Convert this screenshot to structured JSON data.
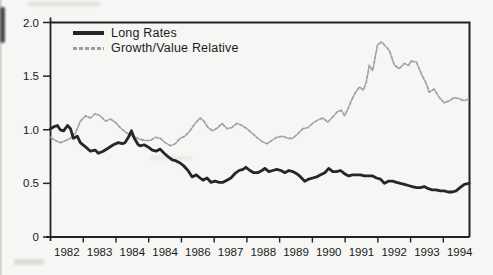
{
  "figure": {
    "background": "#f6f6f4",
    "frame_color": "#232323",
    "text_color": "#1a1a1a"
  },
  "legend": {
    "position": "top-left-inside",
    "items": [
      {
        "label": "Long Rates",
        "swatch_style": "solid-thick",
        "color": "#262626"
      },
      {
        "label": "Growth/Value Relative",
        "swatch_style": "dashed-thin",
        "color": "#a0a0a0"
      }
    ]
  },
  "chart_data": {
    "type": "line",
    "title": "",
    "xlabel": "",
    "ylabel": "",
    "grid": false,
    "legend_position": "top-left-inside",
    "x_axis": {
      "min": 1981.5,
      "max": 1994.3,
      "tick_label_positions": [
        1982,
        1983,
        1984,
        1985,
        1986,
        1987,
        1988,
        1989,
        1990,
        1991,
        1992,
        1993,
        1994
      ],
      "tick_labels": [
        "1982",
        "1983",
        "1984",
        "1984",
        "1986",
        "1987",
        "1988",
        "1989",
        "1990",
        "1991",
        "1992",
        "1993",
        "1994"
      ],
      "minor_tick_positions": [
        1982.5,
        1983.5,
        1984.5,
        1985.5,
        1986.5,
        1987.5,
        1988.5,
        1989.5,
        1990.5,
        1991.5,
        1992.5,
        1993.5
      ]
    },
    "y_axis": {
      "min": 0,
      "max": 2.0,
      "tick_values": [
        0,
        0.5,
        1.0,
        1.5,
        2.0
      ],
      "tick_labels": [
        "0",
        "0.5",
        "1.0",
        "1.5",
        "2.0"
      ]
    },
    "series": [
      {
        "name": "Long Rates",
        "color": "#262626",
        "style": "solid",
        "stroke_width": 2.8,
        "points": [
          [
            1981.5,
            1.01
          ],
          [
            1981.62,
            1.03
          ],
          [
            1981.71,
            1.04
          ],
          [
            1981.8,
            1.0
          ],
          [
            1981.9,
            0.99
          ],
          [
            1982.02,
            1.04
          ],
          [
            1982.11,
            1.01
          ],
          [
            1982.2,
            0.92
          ],
          [
            1982.32,
            0.94
          ],
          [
            1982.41,
            0.88
          ],
          [
            1982.57,
            0.84
          ],
          [
            1982.72,
            0.8
          ],
          [
            1982.87,
            0.81
          ],
          [
            1982.96,
            0.78
          ],
          [
            1983.11,
            0.8
          ],
          [
            1983.27,
            0.83
          ],
          [
            1983.42,
            0.86
          ],
          [
            1983.57,
            0.88
          ],
          [
            1983.69,
            0.87
          ],
          [
            1983.78,
            0.88
          ],
          [
            1983.88,
            0.93
          ],
          [
            1983.97,
            0.99
          ],
          [
            1984.06,
            0.92
          ],
          [
            1984.18,
            0.86
          ],
          [
            1984.27,
            0.85
          ],
          [
            1984.36,
            0.86
          ],
          [
            1984.48,
            0.84
          ],
          [
            1984.61,
            0.81
          ],
          [
            1984.73,
            0.8
          ],
          [
            1984.85,
            0.82
          ],
          [
            1984.97,
            0.78
          ],
          [
            1985.09,
            0.75
          ],
          [
            1985.22,
            0.72
          ],
          [
            1985.34,
            0.71
          ],
          [
            1985.46,
            0.69
          ],
          [
            1985.58,
            0.66
          ],
          [
            1985.7,
            0.62
          ],
          [
            1985.83,
            0.56
          ],
          [
            1985.95,
            0.58
          ],
          [
            1986.07,
            0.55
          ],
          [
            1986.16,
            0.53
          ],
          [
            1986.28,
            0.55
          ],
          [
            1986.4,
            0.51
          ],
          [
            1986.53,
            0.52
          ],
          [
            1986.65,
            0.51
          ],
          [
            1986.77,
            0.51
          ],
          [
            1986.89,
            0.53
          ],
          [
            1987.01,
            0.55
          ],
          [
            1987.13,
            0.59
          ],
          [
            1987.26,
            0.62
          ],
          [
            1987.38,
            0.63
          ],
          [
            1987.47,
            0.65
          ],
          [
            1987.59,
            0.62
          ],
          [
            1987.71,
            0.6
          ],
          [
            1987.83,
            0.6
          ],
          [
            1987.96,
            0.62
          ],
          [
            1988.05,
            0.64
          ],
          [
            1988.17,
            0.61
          ],
          [
            1988.29,
            0.62
          ],
          [
            1988.41,
            0.63
          ],
          [
            1988.54,
            0.62
          ],
          [
            1988.66,
            0.6
          ],
          [
            1988.78,
            0.62
          ],
          [
            1988.9,
            0.61
          ],
          [
            1989.02,
            0.59
          ],
          [
            1989.14,
            0.56
          ],
          [
            1989.27,
            0.52
          ],
          [
            1989.39,
            0.54
          ],
          [
            1989.51,
            0.55
          ],
          [
            1989.63,
            0.56
          ],
          [
            1989.75,
            0.58
          ],
          [
            1989.88,
            0.6
          ],
          [
            1990.0,
            0.64
          ],
          [
            1990.12,
            0.61
          ],
          [
            1990.24,
            0.61
          ],
          [
            1990.36,
            0.62
          ],
          [
            1990.48,
            0.59
          ],
          [
            1990.61,
            0.57
          ],
          [
            1990.73,
            0.58
          ],
          [
            1990.85,
            0.58
          ],
          [
            1990.97,
            0.58
          ],
          [
            1991.09,
            0.57
          ],
          [
            1991.22,
            0.57
          ],
          [
            1991.34,
            0.57
          ],
          [
            1991.46,
            0.55
          ],
          [
            1991.58,
            0.54
          ],
          [
            1991.7,
            0.5
          ],
          [
            1991.82,
            0.52
          ],
          [
            1991.95,
            0.52
          ],
          [
            1992.07,
            0.51
          ],
          [
            1992.19,
            0.5
          ],
          [
            1992.31,
            0.49
          ],
          [
            1992.43,
            0.48
          ],
          [
            1992.55,
            0.47
          ],
          [
            1992.68,
            0.46
          ],
          [
            1992.8,
            0.46
          ],
          [
            1992.92,
            0.47
          ],
          [
            1993.04,
            0.45
          ],
          [
            1993.16,
            0.44
          ],
          [
            1993.28,
            0.44
          ],
          [
            1993.41,
            0.43
          ],
          [
            1993.53,
            0.43
          ],
          [
            1993.65,
            0.42
          ],
          [
            1993.77,
            0.42
          ],
          [
            1993.89,
            0.43
          ],
          [
            1994.01,
            0.46
          ],
          [
            1994.14,
            0.49
          ],
          [
            1994.29,
            0.5
          ]
        ]
      },
      {
        "name": "Growth/Value Relative",
        "color": "#a0a0a0",
        "style": "dashed",
        "stroke_width": 1.7,
        "points": [
          [
            1981.5,
            0.93
          ],
          [
            1981.65,
            0.9
          ],
          [
            1981.8,
            0.88
          ],
          [
            1981.96,
            0.9
          ],
          [
            1982.11,
            0.92
          ],
          [
            1982.26,
            0.97
          ],
          [
            1982.41,
            1.08
          ],
          [
            1982.57,
            1.13
          ],
          [
            1982.72,
            1.11
          ],
          [
            1982.87,
            1.15
          ],
          [
            1983.02,
            1.13
          ],
          [
            1983.18,
            1.08
          ],
          [
            1983.33,
            1.1
          ],
          [
            1983.48,
            1.07
          ],
          [
            1983.63,
            1.02
          ],
          [
            1983.78,
            0.98
          ],
          [
            1983.94,
            0.95
          ],
          [
            1984.09,
            0.93
          ],
          [
            1984.24,
            0.91
          ],
          [
            1984.39,
            0.9
          ],
          [
            1984.55,
            0.9
          ],
          [
            1984.7,
            0.93
          ],
          [
            1984.85,
            0.92
          ],
          [
            1985.0,
            0.88
          ],
          [
            1985.16,
            0.85
          ],
          [
            1985.31,
            0.87
          ],
          [
            1985.46,
            0.92
          ],
          [
            1985.61,
            0.94
          ],
          [
            1985.76,
            0.99
          ],
          [
            1985.92,
            1.06
          ],
          [
            1986.07,
            1.11
          ],
          [
            1986.19,
            1.08
          ],
          [
            1986.31,
            1.02
          ],
          [
            1986.46,
            0.99
          ],
          [
            1986.61,
            1.02
          ],
          [
            1986.74,
            1.06
          ],
          [
            1986.89,
            1.01
          ],
          [
            1987.04,
            1.02
          ],
          [
            1987.19,
            1.06
          ],
          [
            1987.35,
            1.04
          ],
          [
            1987.5,
            1.01
          ],
          [
            1987.65,
            0.97
          ],
          [
            1987.8,
            0.93
          ],
          [
            1987.96,
            0.89
          ],
          [
            1988.11,
            0.87
          ],
          [
            1988.26,
            0.9
          ],
          [
            1988.41,
            0.93
          ],
          [
            1988.6,
            0.94
          ],
          [
            1988.75,
            0.92
          ],
          [
            1988.9,
            0.92
          ],
          [
            1989.05,
            0.96
          ],
          [
            1989.21,
            1.01
          ],
          [
            1989.36,
            1.02
          ],
          [
            1989.51,
            1.06
          ],
          [
            1989.66,
            1.09
          ],
          [
            1989.82,
            1.11
          ],
          [
            1989.97,
            1.07
          ],
          [
            1990.12,
            1.12
          ],
          [
            1990.27,
            1.17
          ],
          [
            1990.39,
            1.18
          ],
          [
            1990.48,
            1.13
          ],
          [
            1990.61,
            1.21
          ],
          [
            1990.7,
            1.28
          ],
          [
            1990.82,
            1.35
          ],
          [
            1990.94,
            1.4
          ],
          [
            1991.06,
            1.37
          ],
          [
            1991.15,
            1.45
          ],
          [
            1991.24,
            1.6
          ],
          [
            1991.34,
            1.55
          ],
          [
            1991.49,
            1.79
          ],
          [
            1991.61,
            1.82
          ],
          [
            1991.73,
            1.78
          ],
          [
            1991.85,
            1.74
          ],
          [
            1992.01,
            1.6
          ],
          [
            1992.16,
            1.57
          ],
          [
            1992.31,
            1.62
          ],
          [
            1992.43,
            1.6
          ],
          [
            1992.52,
            1.64
          ],
          [
            1992.68,
            1.63
          ],
          [
            1992.83,
            1.52
          ],
          [
            1992.98,
            1.43
          ],
          [
            1993.07,
            1.35
          ],
          [
            1993.22,
            1.38
          ],
          [
            1993.38,
            1.3
          ],
          [
            1993.53,
            1.25
          ],
          [
            1993.68,
            1.27
          ],
          [
            1993.83,
            1.3
          ],
          [
            1993.98,
            1.29
          ],
          [
            1994.14,
            1.27
          ],
          [
            1994.29,
            1.29
          ]
        ]
      }
    ]
  }
}
